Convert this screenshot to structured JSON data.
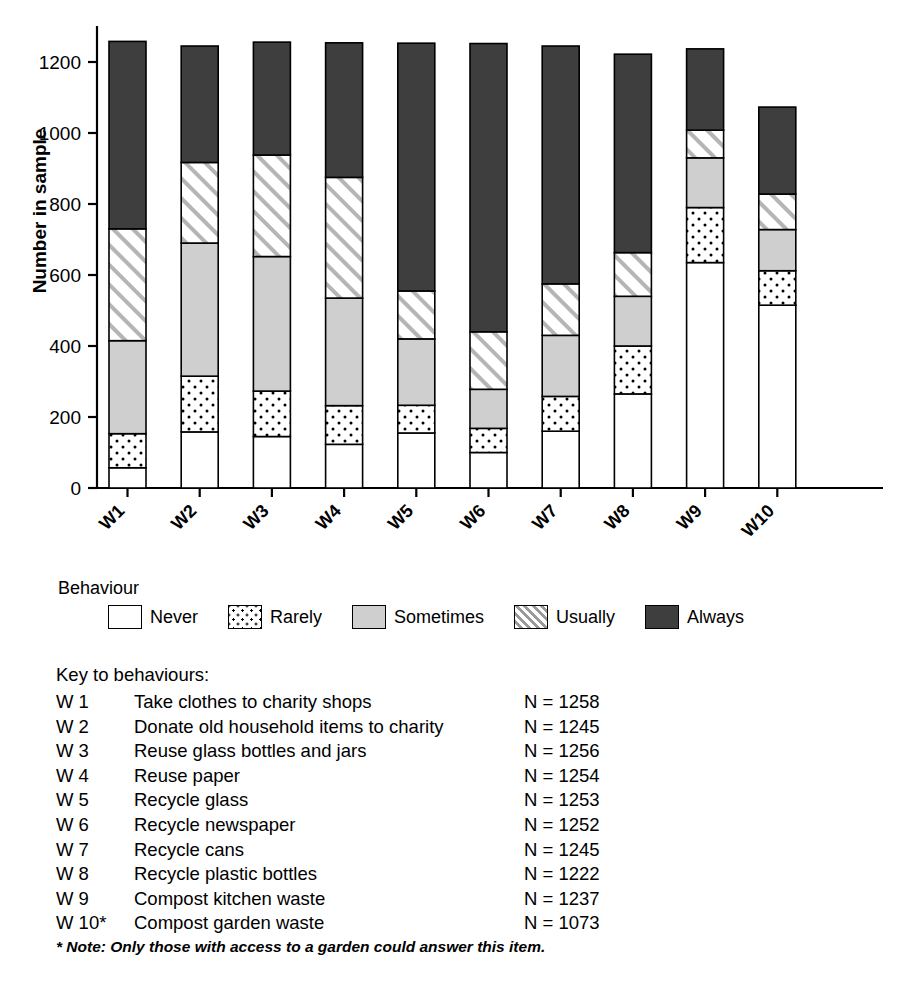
{
  "chart_data": {
    "type": "bar",
    "subtype": "stacked-bar",
    "title": "",
    "xlabel": "",
    "ylabel": "Number in sample",
    "ylim": [
      0,
      1300
    ],
    "yticks": [
      0,
      200,
      400,
      600,
      800,
      1000,
      1200
    ],
    "grid": false,
    "legend_position": "below-plot",
    "legend_title": "Behaviour",
    "categories": [
      "W1",
      "W2",
      "W3",
      "W4",
      "W5",
      "W6",
      "W7",
      "W8",
      "W9",
      "W10"
    ],
    "series": [
      {
        "name": "Never",
        "pattern": "solid-white",
        "color": "#ffffff",
        "values": [
          57,
          158,
          145,
          123,
          155,
          100,
          160,
          265,
          635,
          515
        ]
      },
      {
        "name": "Rarely",
        "pattern": "dotted",
        "color": "#ffffff",
        "values": [
          96,
          157,
          128,
          109,
          78,
          68,
          98,
          135,
          155,
          97
        ]
      },
      {
        "name": "Sometimes",
        "pattern": "solid-gray",
        "color": "#cfcfcf",
        "values": [
          262,
          375,
          379,
          303,
          187,
          110,
          172,
          140,
          140,
          116
        ]
      },
      {
        "name": "Usually",
        "pattern": "hatched",
        "color": "#ffffff",
        "values": [
          315,
          227,
          286,
          340,
          135,
          162,
          145,
          123,
          78,
          100
        ]
      },
      {
        "name": "Always",
        "pattern": "solid-dark",
        "color": "#3e3e3e",
        "values": [
          528,
          328,
          318,
          379,
          698,
          812,
          670,
          559,
          229,
          245
        ]
      }
    ],
    "totals": [
      1258,
      1245,
      1256,
      1254,
      1253,
      1252,
      1245,
      1222,
      1237,
      1073
    ]
  },
  "yaxis": {
    "title": "Number in sample",
    "ticks": [
      "0",
      "200",
      "400",
      "600",
      "800",
      "1000",
      "1200"
    ]
  },
  "xaxis": {
    "ticks": [
      "W1",
      "W2",
      "W3",
      "W4",
      "W5",
      "W6",
      "W7",
      "W8",
      "W9",
      "W10"
    ]
  },
  "legend": {
    "title": "Behaviour",
    "items": [
      {
        "label": "Never",
        "swatch": "white-square-icon"
      },
      {
        "label": "Rarely",
        "swatch": "dotted-square-icon"
      },
      {
        "label": "Sometimes",
        "swatch": "gray-square-icon"
      },
      {
        "label": "Usually",
        "swatch": "hatched-square-icon"
      },
      {
        "label": "Always",
        "swatch": "dark-square-icon"
      }
    ]
  },
  "key": {
    "title": "Key to behaviours:",
    "rows": [
      {
        "code": "W 1",
        "desc": "Take clothes to charity shops",
        "n": "N = 1258"
      },
      {
        "code": "W 2",
        "desc": "Donate old household items to charity",
        "n": "N = 1245"
      },
      {
        "code": "W 3",
        "desc": "Reuse glass bottles and jars",
        "n": "N = 1256"
      },
      {
        "code": "W 4",
        "desc": "Reuse paper",
        "n": "N = 1254"
      },
      {
        "code": "W 5",
        "desc": "Recycle glass",
        "n": "N = 1253"
      },
      {
        "code": "W 6",
        "desc": "Recycle newspaper",
        "n": "N = 1252"
      },
      {
        "code": "W 7",
        "desc": "Recycle cans",
        "n": "N = 1245"
      },
      {
        "code": "W 8",
        "desc": "Recycle plastic bottles",
        "n": "N = 1222"
      },
      {
        "code": "W 9",
        "desc": "Compost kitchen waste",
        "n": "N = 1237"
      },
      {
        "code": "W 10*",
        "desc": "Compost garden waste",
        "n": "N = 1073"
      }
    ],
    "note": "* Note: Only those with access to a garden could answer this item."
  },
  "colors": {
    "always": "#3e3e3e",
    "sometimes": "#cfcfcf",
    "outline": "#000000"
  }
}
